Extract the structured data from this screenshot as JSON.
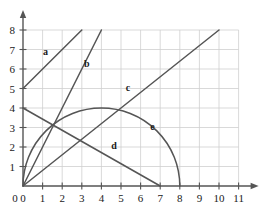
{
  "chart_data": {
    "type": "line",
    "title": "",
    "xlabel": "",
    "ylabel": "",
    "xlim": [
      0,
      11
    ],
    "ylim": [
      0,
      8
    ],
    "grid": true,
    "legend": "inline-labels",
    "x_ticks": [
      "0",
      "1",
      "2",
      "3",
      "4",
      "5",
      "6",
      "7",
      "8",
      "9",
      "10",
      "11"
    ],
    "y_ticks": [
      "0",
      "1",
      "2",
      "3",
      "4",
      "5",
      "6",
      "7",
      "8"
    ],
    "series": [
      {
        "name": "a",
        "label": "a",
        "kind": "line",
        "equation": "y = x + 5",
        "x": [
          0,
          3
        ],
        "values": [
          5,
          8
        ],
        "label_at": [
          1.15,
          6.7
        ]
      },
      {
        "name": "b",
        "label": "b",
        "kind": "line",
        "equation": "y = 2x",
        "x": [
          0,
          4
        ],
        "values": [
          0,
          8
        ],
        "label_at": [
          3.25,
          6.1
        ]
      },
      {
        "name": "c",
        "label": "c",
        "kind": "line",
        "equation": "y = 0.8x",
        "x": [
          0,
          10
        ],
        "values": [
          0,
          8
        ],
        "label_at": [
          5.35,
          4.85
        ]
      },
      {
        "name": "d",
        "label": "d",
        "kind": "line",
        "equation": "y = 4 - (4/7)x",
        "x": [
          0,
          7
        ],
        "values": [
          4,
          0
        ],
        "label_at": [
          4.65,
          1.9
        ]
      },
      {
        "name": "e",
        "label": "e",
        "kind": "semicircle",
        "equation": "(x-4)^2 + y^2 = 16, y >= 0",
        "center": [
          4,
          0
        ],
        "radius": 4,
        "x": [
          0,
          8
        ],
        "values": [
          0,
          0
        ],
        "label_at": [
          6.6,
          2.85
        ]
      }
    ],
    "colors": {
      "curve": "#555555",
      "grid": "#cfcfcf",
      "axis": "#555555",
      "text": "#1a1a1a",
      "background": "#ffffff"
    }
  },
  "axes": {
    "x_axis_name": "x-axis",
    "y_axis_name": "y-axis"
  }
}
